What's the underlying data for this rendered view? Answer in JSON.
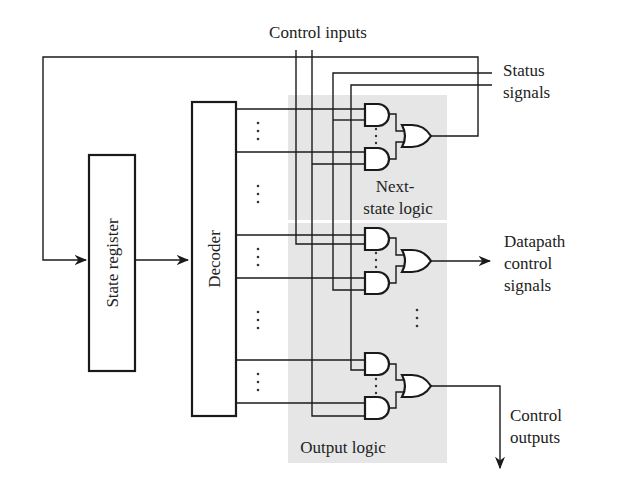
{
  "labels": {
    "control_inputs": "Control inputs",
    "status_line1": "Status",
    "status_line2": "signals",
    "state_register": "State register",
    "decoder": "Decoder",
    "next_state_line1": "Next-",
    "next_state_line2": "state logic",
    "datapath_line1": "Datapath",
    "datapath_line2": "control",
    "datapath_line3": "signals",
    "control_outputs_line1": "Control",
    "control_outputs_line2": "outputs",
    "output_logic": "Output logic"
  },
  "blocks": [
    {
      "name": "State register",
      "type": "register"
    },
    {
      "name": "Decoder",
      "type": "decoder"
    },
    {
      "name": "Next-state logic",
      "type": "logic-region",
      "gates": [
        "AND",
        "AND",
        "OR"
      ]
    },
    {
      "name": "Output logic",
      "type": "logic-region",
      "groups": [
        {
          "output": "Datapath control signals",
          "gates": [
            "AND",
            "AND",
            "OR"
          ]
        },
        {
          "output": "Control outputs",
          "gates": [
            "AND",
            "AND",
            "OR"
          ]
        }
      ]
    }
  ],
  "ellipsis": "⋮",
  "colors": {
    "line": "#1a1a1a",
    "region": "#e6e6e6",
    "background": "#ffffff"
  }
}
